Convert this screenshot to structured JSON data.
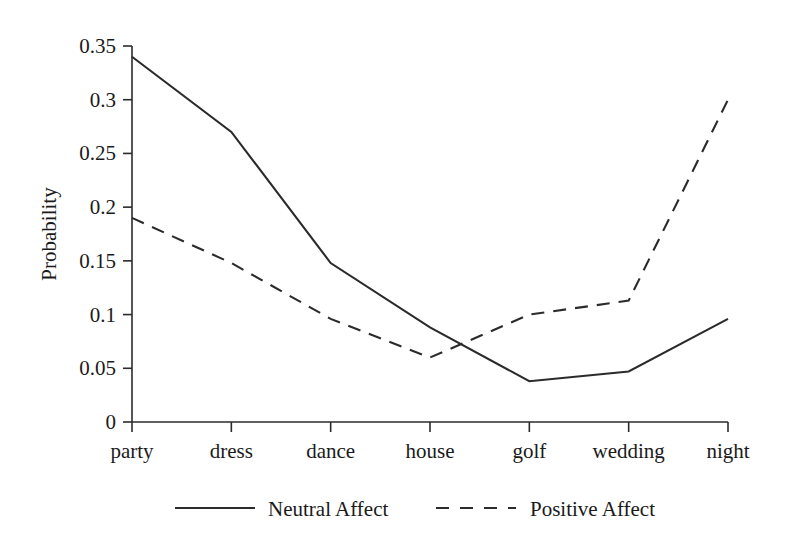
{
  "chart_data": {
    "type": "line",
    "title": "",
    "xlabel": "",
    "ylabel": "Probability",
    "categories": [
      "party",
      "dress",
      "dance",
      "house",
      "golf",
      "wedding",
      "night"
    ],
    "yticks": [
      "0",
      "0.05",
      "0.1",
      "0.15",
      "0.2",
      "0.25",
      "0.3",
      "0.35"
    ],
    "ytick_values": [
      0,
      0.05,
      0.1,
      0.15,
      0.2,
      0.25,
      0.3,
      0.35
    ],
    "ylim": [
      0,
      0.35
    ],
    "grid": false,
    "legend_position": "bottom",
    "series": [
      {
        "name": "Neutral Affect",
        "style": "solid",
        "color": "#2b2b2b",
        "values": [
          0.34,
          0.27,
          0.148,
          0.088,
          0.038,
          0.047,
          0.096
        ]
      },
      {
        "name": "Positive Affect",
        "style": "dashed",
        "color": "#2b2b2b",
        "values": [
          0.19,
          0.148,
          0.096,
          0.06,
          0.1,
          0.113,
          0.3
        ]
      }
    ]
  },
  "legend": {
    "items": [
      {
        "label": "Neutral Affect",
        "style": "solid"
      },
      {
        "label": "Positive Affect",
        "style": "dashed"
      }
    ]
  }
}
